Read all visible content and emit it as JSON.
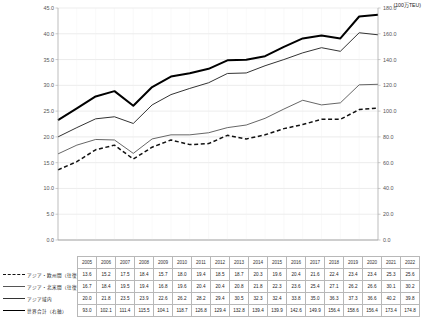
{
  "unit_label": "(100万TEU)",
  "axes": {
    "left_ticks": [
      "45.0",
      "40.0",
      "35.0",
      "30.0",
      "25.0",
      "20.0",
      "15.0",
      "10.0",
      "5.0",
      "0.0"
    ],
    "right_ticks": [
      "180.0",
      "160.0",
      "140.0",
      "120.0",
      "100.0",
      "80.0",
      "60.0",
      "40.0",
      "20.0",
      "0.0"
    ],
    "left_min": 0,
    "left_max": 45,
    "left_step": 5,
    "right_min": 0,
    "right_max": 180,
    "right_step": 20
  },
  "chart_data": {
    "type": "line",
    "title": "",
    "xlabel": "",
    "ylabel": "",
    "unit": "(100万TEU)",
    "grid": true,
    "legend_position": "table-left",
    "categories": [
      "2005",
      "2006",
      "2007",
      "2008",
      "2009",
      "2010",
      "2011",
      "2012",
      "2013",
      "2014",
      "2015",
      "2016",
      "2017",
      "2018",
      "2019",
      "2020",
      "2021",
      "2022"
    ],
    "ylim": [
      0,
      45
    ],
    "y2lim": [
      0,
      180
    ],
    "series": [
      {
        "name": "アジア・欧州間（往復）",
        "style": "dashed",
        "axis": "left",
        "values": [
          13.6,
          15.2,
          17.5,
          18.4,
          15.7,
          18.0,
          19.4,
          18.5,
          18.7,
          20.3,
          19.6,
          20.4,
          21.6,
          22.4,
          23.4,
          23.4,
          25.3,
          25.6
        ]
      },
      {
        "name": "アジア・北米間（往復）",
        "style": "thin",
        "axis": "left",
        "values": [
          16.7,
          18.4,
          19.5,
          19.4,
          16.8,
          19.6,
          20.4,
          20.4,
          20.8,
          21.8,
          22.3,
          23.6,
          25.4,
          27.1,
          26.2,
          26.6,
          30.1,
          30.2
        ]
      },
      {
        "name": "アジア域内",
        "style": "medium",
        "axis": "left",
        "values": [
          20.0,
          21.8,
          23.5,
          23.9,
          22.6,
          26.2,
          28.2,
          29.4,
          30.5,
          32.3,
          32.4,
          33.8,
          35.0,
          36.3,
          37.3,
          36.6,
          40.2,
          39.8
        ]
      },
      {
        "name": "世界合計（右軸）",
        "style": "thick",
        "axis": "right",
        "values": [
          93.0,
          102.1,
          111.4,
          115.5,
          104.1,
          118.7,
          126.8,
          129.4,
          132.8,
          139.4,
          139.9,
          142.6,
          149.9,
          156.4,
          158.6,
          156.4,
          173.4,
          174.8
        ]
      }
    ]
  },
  "table": {
    "corner_label": "",
    "year_headers": [
      "2005",
      "2006",
      "2007",
      "2008",
      "2009",
      "2010",
      "2011",
      "2012",
      "2013",
      "2014",
      "2015",
      "2016",
      "2017",
      "2018",
      "2019",
      "2020",
      "2021",
      "2022"
    ],
    "rows": [
      {
        "label": "アジア・欧州間（往復）",
        "swatch": "dashed-line-swatch",
        "values": [
          "13.6",
          "15.2",
          "17.5",
          "18.4",
          "15.7",
          "18.0",
          "19.4",
          "18.5",
          "18.7",
          "20.3",
          "19.6",
          "20.4",
          "21.6",
          "22.4",
          "23.4",
          "23.4",
          "25.3",
          "25.6"
        ]
      },
      {
        "label": "アジア・北米間（往復）",
        "swatch": "thin-line-swatch",
        "values": [
          "16.7",
          "18.4",
          "19.5",
          "19.4",
          "16.8",
          "19.6",
          "20.4",
          "20.4",
          "20.8",
          "21.8",
          "22.3",
          "23.6",
          "25.4",
          "27.1",
          "26.2",
          "26.6",
          "30.1",
          "30.2"
        ]
      },
      {
        "label": "アジア域内",
        "swatch": "medium-line-swatch",
        "values": [
          "20.0",
          "21.8",
          "23.5",
          "23.9",
          "22.6",
          "26.2",
          "28.2",
          "29.4",
          "30.5",
          "32.3",
          "32.4",
          "33.8",
          "35.0",
          "36.3",
          "37.3",
          "36.6",
          "40.2",
          "39.8"
        ]
      },
      {
        "label": "世界合計（右軸）",
        "swatch": "thick-line-swatch",
        "values": [
          "93.0",
          "102.1",
          "111.4",
          "115.5",
          "104.1",
          "118.7",
          "126.8",
          "129.4",
          "132.8",
          "139.4",
          "139.9",
          "142.6",
          "149.9",
          "156.4",
          "158.6",
          "156.4",
          "173.4",
          "174.8"
        ]
      }
    ]
  },
  "colors": {
    "grid": "#d9d9d9",
    "axis": "#999999",
    "series_dashed": "#111111",
    "series_thin": "#555555",
    "series_medium": "#333333",
    "series_thick": "#000000"
  }
}
